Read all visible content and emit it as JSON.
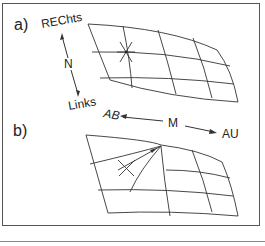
{
  "figure": {
    "panel_a": {
      "label": "a)",
      "axis_top": "REChts",
      "axis_mid": "N",
      "axis_bottom": "Links"
    },
    "axis_horizontal": {
      "left": "AB",
      "mid": "M",
      "right": "AU"
    },
    "panel_b": {
      "label": "b)"
    }
  }
}
